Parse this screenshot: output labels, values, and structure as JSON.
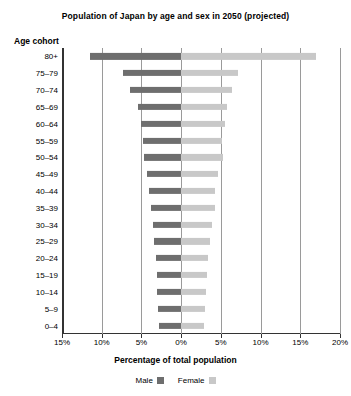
{
  "chart_data": {
    "type": "bar",
    "title": "Population of Japan by age and sex in 2050 (projected)",
    "xlabel": "Percentage of total population",
    "ylabel": "Age cohort",
    "orientation": "horizontal",
    "style": "population-pyramid",
    "grid": true,
    "legend_position": "bottom",
    "xlim": [
      -15,
      20
    ],
    "xticks": [
      -15,
      -10,
      -5,
      0,
      5,
      10,
      15,
      20
    ],
    "xtick_labels": [
      "15%",
      "10%",
      "5%",
      "0%",
      "5%",
      "10%",
      "15%",
      "20%"
    ],
    "categories": [
      "80+",
      "75–79",
      "70–74",
      "65–69",
      "60–64",
      "55–59",
      "50–54",
      "45–49",
      "40–44",
      "35–39",
      "30–34",
      "25–29",
      "20–24",
      "15–19",
      "10–14",
      "5–9",
      "0–4"
    ],
    "series": [
      {
        "name": "Male",
        "color": "#6e6e6e",
        "direction": "left",
        "values": [
          11.5,
          7.3,
          6.4,
          5.4,
          5.0,
          4.8,
          4.7,
          4.3,
          4.0,
          3.8,
          3.6,
          3.4,
          3.2,
          3.1,
          3.0,
          2.9,
          2.8
        ]
      },
      {
        "name": "Female",
        "color": "#c8c8c8",
        "direction": "right",
        "values": [
          17.0,
          7.1,
          6.4,
          5.8,
          5.5,
          5.2,
          5.3,
          4.6,
          4.3,
          4.2,
          3.9,
          3.6,
          3.4,
          3.2,
          3.1,
          3.0,
          2.9
        ]
      }
    ]
  },
  "legend": {
    "male_label": "Male",
    "female_label": "Female"
  }
}
